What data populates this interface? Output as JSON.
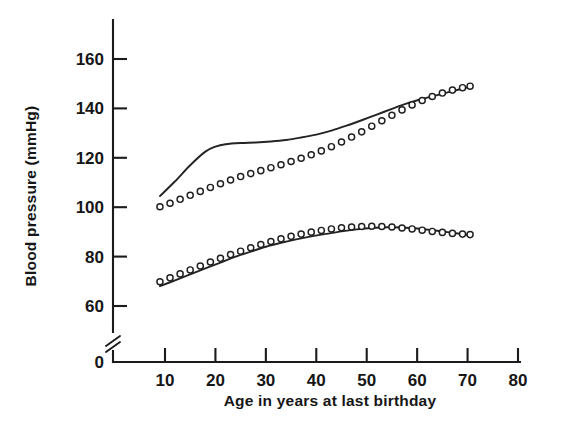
{
  "chart_data": {
    "type": "line",
    "title": "",
    "xlabel": "Age in years at last birthday",
    "ylabel": "Blood pressure (mmHg)",
    "xlim": [
      0,
      80
    ],
    "ylim": [
      50,
      170
    ],
    "y_axis_break": true,
    "y_axis_break_label": "0",
    "grid": false,
    "legend": null,
    "xticks": [
      10,
      20,
      30,
      40,
      50,
      60,
      70,
      80
    ],
    "xtick_labels": [
      "10",
      "20",
      "30",
      "40",
      "50",
      "60",
      "70",
      "80"
    ],
    "yticks": [
      60,
      80,
      100,
      120,
      140,
      160
    ],
    "ytick_labels": [
      "60",
      "80",
      "100",
      "120",
      "140",
      "160"
    ],
    "zero_tick_label": "0",
    "series": [
      {
        "name": "systolic-line",
        "style": "solid-line",
        "marker": "none",
        "x": [
          9,
          12,
          15,
          18,
          20,
          22,
          25,
          28,
          31,
          34,
          37,
          40,
          43,
          46,
          49,
          52,
          55,
          58,
          61,
          64,
          67,
          70
        ],
        "values": [
          104.5,
          110.5,
          117,
          122.5,
          124.5,
          125.5,
          126,
          126.2,
          126.6,
          127.2,
          128.2,
          129.4,
          131,
          133,
          135.2,
          137.5,
          139.8,
          142,
          143.8,
          145.4,
          147,
          148.5
        ]
      },
      {
        "name": "systolic-circles",
        "style": "open-circles",
        "marker": "o",
        "x": [
          9,
          11,
          13,
          15,
          17,
          19,
          21,
          23,
          25,
          27,
          29,
          31,
          33,
          35,
          37,
          39,
          41,
          43,
          45,
          47,
          49,
          51,
          53,
          55,
          57,
          59,
          61,
          63,
          65,
          67,
          69,
          70.5
        ],
        "values": [
          100.2,
          101.6,
          103.2,
          104.8,
          106.4,
          108.0,
          109.5,
          111.0,
          112.4,
          113.6,
          114.8,
          116.0,
          117.2,
          118.5,
          119.8,
          121.2,
          122.8,
          124.5,
          126.4,
          128.4,
          130.5,
          132.8,
          135.0,
          137.2,
          139.4,
          141.4,
          143.2,
          144.8,
          146.2,
          147.4,
          148.4,
          149.0
        ]
      },
      {
        "name": "diastolic-line",
        "style": "solid-line",
        "marker": "none",
        "x": [
          9,
          12,
          15,
          18,
          21,
          24,
          27,
          30,
          33,
          36,
          39,
          42,
          45,
          48,
          51,
          54,
          57,
          60,
          63,
          66,
          70
        ],
        "values": [
          68.0,
          70.4,
          72.8,
          75.2,
          77.6,
          80.0,
          82.0,
          84.0,
          85.6,
          87.0,
          88.2,
          89.2,
          90.2,
          91.0,
          91.6,
          91.9,
          91.8,
          91.4,
          90.7,
          89.9,
          88.8
        ]
      },
      {
        "name": "diastolic-circles",
        "style": "open-circles",
        "marker": "o",
        "x": [
          9,
          11,
          13,
          15,
          17,
          19,
          21,
          23,
          25,
          27,
          29,
          31,
          33,
          35,
          37,
          39,
          41,
          43,
          45,
          47,
          49,
          51,
          53,
          55,
          57,
          59,
          61,
          63,
          65,
          67,
          69,
          70.5
        ],
        "values": [
          69.8,
          71.4,
          73.0,
          74.6,
          76.2,
          77.8,
          79.3,
          80.8,
          82.2,
          83.6,
          84.9,
          86.1,
          87.2,
          88.2,
          89.1,
          89.9,
          90.6,
          91.2,
          91.7,
          92.0,
          92.2,
          92.3,
          92.2,
          92.0,
          91.6,
          91.2,
          90.7,
          90.2,
          89.8,
          89.4,
          89.1,
          88.9
        ]
      }
    ]
  }
}
